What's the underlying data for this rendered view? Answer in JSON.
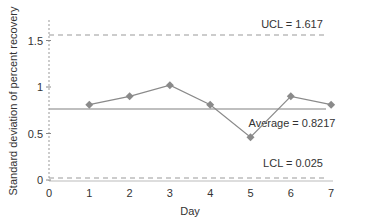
{
  "chart_data": {
    "type": "line",
    "title": "",
    "xlabel": "Day",
    "ylabel": "Standard deviation of percent recovery",
    "x": [
      1,
      2,
      3,
      4,
      5,
      6,
      7
    ],
    "series": [
      {
        "name": "Standard deviation",
        "values": [
          0.81,
          0.9,
          1.02,
          0.81,
          0.46,
          0.9,
          0.81
        ],
        "marker": "diamond",
        "color": "#8a8a8a"
      }
    ],
    "xticks": [
      "0",
      "1",
      "2",
      "3",
      "4",
      "5",
      "6",
      "7"
    ],
    "yticks": [
      "0",
      "0.5",
      "1",
      "1.5"
    ],
    "xlim": [
      0,
      7
    ],
    "ylim": [
      0,
      1.7
    ],
    "grid": false,
    "reference_lines": [
      {
        "name": "UCL",
        "value": 1.617,
        "label": "UCL = 1.617",
        "style": "dashed"
      },
      {
        "name": "Average",
        "value": 0.8217,
        "label": "Average = 0.8217",
        "style": "solid"
      },
      {
        "name": "LCL",
        "value": 0.025,
        "label": "LCL = 0.025",
        "style": "dashed"
      }
    ]
  }
}
